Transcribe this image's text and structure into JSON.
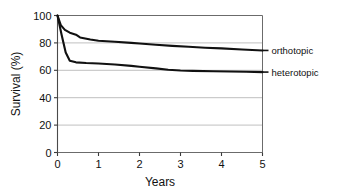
{
  "chart_data": {
    "type": "line",
    "title": "",
    "xlabel": "Years",
    "ylabel": "Survival (%)",
    "xlim": [
      0,
      5
    ],
    "ylim": [
      0,
      100
    ],
    "xticks": [
      "0",
      "1",
      "2",
      "3",
      "4",
      "5"
    ],
    "yticks": [
      "0",
      "20",
      "40",
      "60",
      "80",
      "100"
    ],
    "grid": "horizontal gridlines at 0, 20, 40, 60, 80, 100",
    "legend_position": "right of plot, inline at series endpoints",
    "series": [
      {
        "name": "orthotopic",
        "label": "orthotopic",
        "color": "#111111",
        "x": [
          0,
          0.08,
          0.18,
          0.3,
          0.45,
          0.55,
          0.8,
          1.0,
          1.4,
          1.8,
          2.0,
          2.4,
          2.8,
          3.2,
          3.6,
          4.0,
          4.5,
          5.0
        ],
        "values": [
          100,
          93,
          89.5,
          87.5,
          86,
          84,
          82.5,
          81.6,
          80.8,
          80,
          79.6,
          78.6,
          77.8,
          77.2,
          76.5,
          76,
          75.2,
          74.5
        ],
        "endpoint_value": 74.5
      },
      {
        "name": "heterotopic",
        "label": "heterotopic",
        "color": "#111111",
        "x": [
          0,
          0.1,
          0.2,
          0.3,
          0.45,
          0.7,
          1.0,
          1.4,
          1.8,
          2.0,
          2.4,
          2.7,
          3.0,
          3.3,
          3.8,
          4.2,
          4.6,
          5.0
        ],
        "values": [
          100,
          86,
          73,
          67,
          65.8,
          65.3,
          65,
          64.2,
          63.2,
          62.6,
          61.4,
          60.4,
          59.8,
          59.6,
          59.3,
          59.1,
          58.9,
          58.7
        ],
        "endpoint_value": 58.7
      }
    ]
  }
}
